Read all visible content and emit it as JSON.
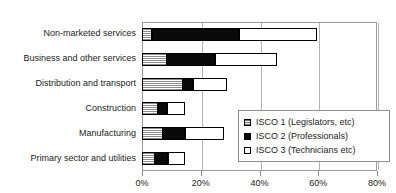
{
  "top_caption": "",
  "chart_data": {
    "type": "bar",
    "orientation": "horizontal",
    "stacked": true,
    "title": "",
    "xlabel": "",
    "ylabel": "",
    "xlim": [
      0,
      80
    ],
    "xunit": "%",
    "grid": true,
    "legend_position": "inside-bottom-right",
    "xticks": [
      0,
      20,
      40,
      60,
      80
    ],
    "xticklabels": [
      "0%",
      "20%",
      "40%",
      "60%",
      "80%"
    ],
    "categories": [
      "Non-marketed services",
      "Business and other services",
      "Distribution and transport",
      "Construction",
      "Manufacturing",
      "Primary sector and utilities"
    ],
    "series": [
      {
        "name": "ISCO 1 (Legislators, etc)",
        "key": "isco1",
        "swatch": "hatched-gray",
        "values": [
          3.5,
          8.5,
          14.0,
          5.5,
          7.0,
          4.5
        ]
      },
      {
        "name": "ISCO 2 (Professionals)",
        "key": "isco2",
        "swatch": "solid-black",
        "values": [
          29.5,
          16.5,
          3.5,
          3.0,
          7.5,
          4.5
        ]
      },
      {
        "name": "ISCO 3 (Technicians etc)",
        "key": "isco3",
        "swatch": "white-open",
        "values": [
          26.5,
          21.0,
          11.5,
          6.0,
          13.5,
          5.5
        ]
      }
    ],
    "totals": [
      59.5,
      46.0,
      29.0,
      14.5,
      28.0,
      14.5
    ]
  },
  "legend": {
    "items": [
      {
        "label": "ISCO 1 (Legislators, etc)",
        "swatch": "hatched-gray"
      },
      {
        "label": "ISCO 2 (Professionals)",
        "swatch": "solid-black"
      },
      {
        "label": "ISCO 3 (Technicians etc)",
        "swatch": "white-open"
      }
    ]
  },
  "colors": {
    "isco1_fill": "#8d8d8d",
    "isco2_fill": "#0a0a0a",
    "isco3_fill": "#ffffff",
    "axis": "#9a9a9a",
    "grid": "#b4b4b4",
    "text": "#1b1b1b"
  }
}
